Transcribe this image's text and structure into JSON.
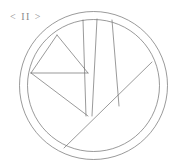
{
  "canvas": {
    "width": 182,
    "height": 166,
    "background": "#ffffff"
  },
  "nav_label": {
    "text": "< II >",
    "color": "#8a8a8a",
    "icon_name": "pause-nav-label"
  },
  "diagram": {
    "stroke_color": "#6e6e6e",
    "stroke_width": 0.7,
    "center": {
      "x": 93.5,
      "y": 85.5
    },
    "outer_radius": 74,
    "inner_radius": 66,
    "chords": [
      {
        "name": "chord-upper-left-diagonal",
        "x1": 57,
        "y1": 35,
        "x2": 88,
        "y2": 73
      },
      {
        "name": "chord-left-vertex-to-hub",
        "x1": 31,
        "y1": 73,
        "x2": 88,
        "y2": 73
      },
      {
        "name": "chord-left-arc-to-apex",
        "x1": 31,
        "y1": 73,
        "x2": 57,
        "y2": 35
      },
      {
        "name": "chord-left-vertex-to-base",
        "x1": 31,
        "y1": 73,
        "x2": 88,
        "y2": 116
      },
      {
        "name": "chord-vertical-left",
        "x1": 83,
        "y1": 20,
        "x2": 86,
        "y2": 116
      },
      {
        "name": "chord-vertical-right",
        "x1": 97,
        "y1": 19,
        "x2": 92,
        "y2": 116
      },
      {
        "name": "chord-right-slant",
        "x1": 112,
        "y1": 20,
        "x2": 119,
        "y2": 106
      },
      {
        "name": "chord-long-diagonal",
        "x1": 64,
        "y1": 148,
        "x2": 152,
        "y2": 62
      }
    ]
  }
}
